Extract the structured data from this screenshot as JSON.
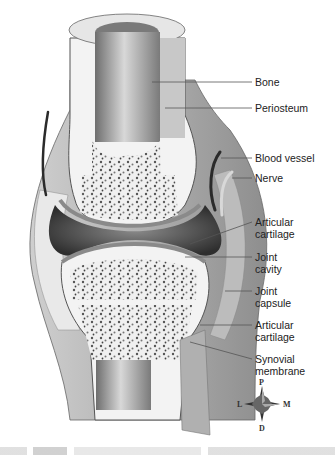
{
  "figure": {
    "labels": [
      {
        "id": "bone",
        "text": "Bone",
        "x": 255,
        "y": 76
      },
      {
        "id": "periosteum",
        "text": "Periosteum",
        "x": 255,
        "y": 102
      },
      {
        "id": "blood-vessel",
        "text": "Blood vessel",
        "x": 255,
        "y": 153
      },
      {
        "id": "nerve",
        "text": "Nerve",
        "x": 255,
        "y": 173
      },
      {
        "id": "articular-cartilage-top",
        "text": "Articular cartilage",
        "x": 255,
        "y": 215
      },
      {
        "id": "joint-cavity",
        "text": "Joint cavity",
        "x": 255,
        "y": 250
      },
      {
        "id": "joint-capsule",
        "text": "Joint capsule",
        "x": 255,
        "y": 284
      },
      {
        "id": "articular-cartilage-bottom",
        "text": "Articular cartilage",
        "x": 255,
        "y": 318
      },
      {
        "id": "synovial-membrane",
        "text": "Synovial membrane",
        "x": 255,
        "y": 352
      }
    ],
    "label_lines": {
      "bone": "Bone",
      "periosteum": "Periosteum",
      "blood_vessel": "Blood vessel",
      "nerve": "Nerve",
      "articular_top_1": "Articular",
      "articular_top_2": "cartilage",
      "joint_cavity_1": "Joint",
      "joint_cavity_2": "cavity",
      "joint_capsule_1": "Joint",
      "joint_capsule_2": "capsule",
      "articular_bottom_1": "Articular",
      "articular_bottom_2": "cartilage",
      "synovial_1": "Synovial",
      "synovial_2": "membrane"
    },
    "compass": {
      "top": "P",
      "bottom": "D",
      "left": "L",
      "right": "M"
    },
    "colors": {
      "bone": "#f2f2f2",
      "marrow_dot": "#555555",
      "cavity": "#3a3a3a",
      "capsule": "#cfcfcf",
      "shaft": "#9a9a9a",
      "line": "#555555"
    }
  }
}
